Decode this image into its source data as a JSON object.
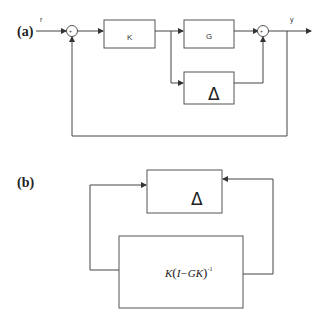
{
  "diagram_a": {
    "label": "(a)",
    "input_signal": "r",
    "output_signal": "y",
    "controller_block": "K",
    "plant_block": "G",
    "uncertainty_block": "Δ",
    "summer_signs": "+",
    "description": "Closed-loop feedback with controller K, plant G, additive uncertainty Δ"
  },
  "diagram_b": {
    "label": "(b)",
    "uncertainty_block": "Δ",
    "transfer_block": {
      "prefix": "K",
      "open": "(",
      "body": "I−GK",
      "close": ")",
      "exponent": "-1"
    },
    "description": "M-Δ interconnection with M = K(I−GK)^-1"
  }
}
